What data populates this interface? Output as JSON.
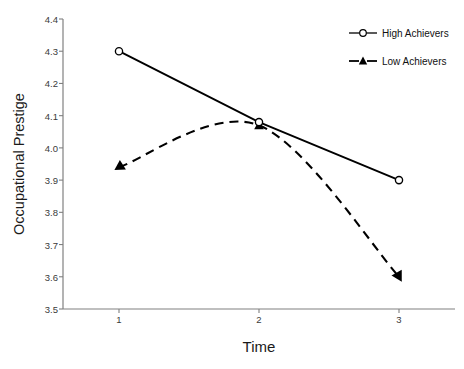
{
  "chart_data": {
    "type": "line",
    "title": "",
    "xlabel": "Time",
    "ylabel": "Occupational Prestige",
    "categories": [
      "1",
      "2",
      "3"
    ],
    "x": [
      1,
      2,
      3
    ],
    "xlim": [
      0.6,
      3.4
    ],
    "ylim": [
      3.5,
      4.4
    ],
    "yticks": [
      "4.4",
      "4.3",
      "4.2",
      "4.1",
      "4.0",
      "3.9",
      "3.8",
      "3.7",
      "3.6",
      "3.5"
    ],
    "ytick_values": [
      4.4,
      4.3,
      4.2,
      4.1,
      4.0,
      3.9,
      3.8,
      3.7,
      3.6,
      3.5
    ],
    "xticks": [
      "1",
      "2",
      "3"
    ],
    "grid": false,
    "legend_position": "top-right",
    "series": [
      {
        "name": "High Achievers",
        "values": [
          4.3,
          4.08,
          3.9
        ],
        "line_style": "solid",
        "marker": "open-circle",
        "color": "#000000"
      },
      {
        "name": "Low Achievers",
        "values": [
          3.94,
          4.07,
          3.6
        ],
        "line_style": "dashed",
        "marker": "filled-triangle",
        "color": "#000000"
      }
    ]
  },
  "axes": {
    "y_title": "Occupational Prestige",
    "x_title": "Time"
  },
  "legend": {
    "entries": [
      {
        "label": "High Achievers",
        "marker": "open-circle",
        "line": "solid"
      },
      {
        "label": "Low Achievers",
        "marker": "filled-triangle",
        "line": "dashed"
      }
    ]
  },
  "colors": {
    "axis": "#808080",
    "series": "#000000",
    "background": "#ffffff",
    "tick_text": "#3a3a3a"
  }
}
